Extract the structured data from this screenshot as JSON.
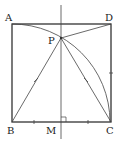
{
  "diagram": {
    "type": "geometry",
    "labels": {
      "A": "A",
      "D": "D",
      "P": "P",
      "B": "B",
      "M": "M",
      "C": "C"
    },
    "colors": {
      "line": "#333333",
      "background": "#ffffff"
    }
  }
}
